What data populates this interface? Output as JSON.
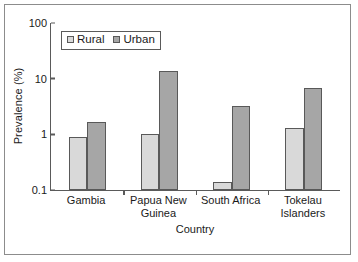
{
  "chart_data": {
    "type": "bar",
    "title": "",
    "xlabel": "Country",
    "ylabel": "Prevalence (%)",
    "categories": [
      "Gambia",
      "Papua New Guinea",
      "South Africa",
      "Tokelau Islanders"
    ],
    "category_lines": [
      [
        "Gambia"
      ],
      [
        "Papua New",
        "Guinea"
      ],
      [
        "South Africa"
      ],
      [
        "Tokelau",
        "Islanders"
      ]
    ],
    "series": [
      {
        "name": "Rural",
        "color": "#d9d9d9",
        "values": [
          0.9,
          1.0,
          0.14,
          1.3
        ]
      },
      {
        "name": "Urban",
        "color": "#a6a6a6",
        "values": [
          1.7,
          13.5,
          3.2,
          6.7
        ]
      }
    ],
    "yscale": "log",
    "ylim": [
      0.1,
      100
    ],
    "yticks": [
      100,
      10,
      1,
      0.1
    ],
    "ytick_labels": [
      "100",
      "10",
      "1",
      "0.1"
    ],
    "grid": false,
    "legend": {
      "position": "top-left-inside",
      "boxed": true,
      "entries": [
        "Rural",
        "Urban"
      ]
    },
    "edge_color": "#595959",
    "axis_color": "#5a5a5a"
  }
}
